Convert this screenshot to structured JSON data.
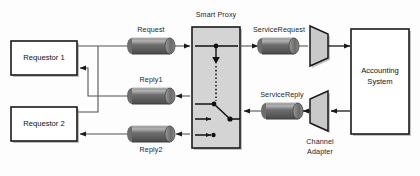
{
  "diagram": {
    "colors": {
      "background": "#fdfdfd",
      "box_fill": "#ffffff",
      "box_stroke": "#1a1a1a",
      "proxy_fill": "#d4d4d4",
      "proxy_stroke": "#1a1a1a",
      "pipe_dark": "#5d5d5d",
      "pipe_light": "#a8a8a8",
      "adapter_fill": "#c9c9c9",
      "line": "#555555",
      "arrow": "#1a1a1a",
      "shadow": "#7a7a7a",
      "text": "#1d1d1d"
    },
    "nodes": {
      "requestor_1": {
        "label": "Requestor 1",
        "type": "process-box"
      },
      "requestor_2": {
        "label": "Requestor 2",
        "type": "process-box"
      },
      "smart_proxy": {
        "label": "Smart Proxy",
        "type": "proxy-box"
      },
      "accounting_system": {
        "label_line1": "Accounting",
        "label_line2": "System",
        "type": "system-box"
      },
      "channel_adapter": {
        "label_line1": "Channel",
        "label_line2": "Adapter",
        "type": "adapter-trapezoid"
      }
    },
    "channels": [
      {
        "id": "request",
        "label": "Request",
        "direction": "right"
      },
      {
        "id": "reply1",
        "label": "Reply1",
        "direction": "left"
      },
      {
        "id": "reply2",
        "label": "Reply2",
        "direction": "left"
      },
      {
        "id": "service_request",
        "label": "ServiceRequest",
        "direction": "right"
      },
      {
        "id": "service_reply",
        "label": "ServiceReply",
        "direction": "left"
      }
    ]
  }
}
